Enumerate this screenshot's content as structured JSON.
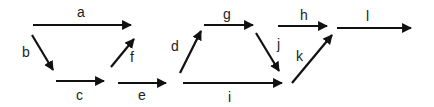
{
  "diagram": {
    "type": "directed-graph",
    "colors": {
      "edge": "#111111",
      "label": "#222222",
      "background": "#ffffff"
    },
    "edges": [
      {
        "id": "a",
        "label": "a",
        "x1": 33,
        "y1": 25,
        "x2": 131,
        "y2": 25,
        "lx": 77,
        "ly": 17
      },
      {
        "id": "b",
        "label": "b",
        "x1": 32,
        "y1": 35,
        "x2": 53,
        "y2": 70,
        "lx": 22,
        "ly": 57
      },
      {
        "id": "c",
        "label": "c",
        "x1": 56,
        "y1": 81,
        "x2": 104,
        "y2": 81,
        "lx": 76,
        "ly": 100
      },
      {
        "id": "f",
        "label": "f",
        "x1": 111,
        "y1": 67,
        "x2": 134,
        "y2": 39,
        "lx": 130,
        "ly": 62
      },
      {
        "id": "e",
        "label": "e",
        "x1": 118,
        "y1": 83,
        "x2": 166,
        "y2": 83,
        "lx": 138,
        "ly": 100
      },
      {
        "id": "d",
        "label": "d",
        "x1": 180,
        "y1": 73,
        "x2": 201,
        "y2": 31,
        "lx": 171,
        "ly": 51
      },
      {
        "id": "g",
        "label": "g",
        "x1": 204,
        "y1": 25,
        "x2": 253,
        "y2": 25,
        "lx": 223,
        "ly": 19
      },
      {
        "id": "i",
        "label": "i",
        "x1": 183,
        "y1": 83,
        "x2": 282,
        "y2": 83,
        "lx": 228,
        "ly": 102
      },
      {
        "id": "j",
        "label": "j",
        "x1": 256,
        "y1": 33,
        "x2": 279,
        "y2": 71,
        "lx": 277,
        "ly": 49
      },
      {
        "id": "h",
        "label": "h",
        "x1": 278,
        "y1": 26,
        "x2": 327,
        "y2": 26,
        "lx": 300,
        "ly": 20
      },
      {
        "id": "k",
        "label": "k",
        "x1": 292,
        "y1": 83,
        "x2": 332,
        "y2": 35,
        "lx": 296,
        "ly": 61
      },
      {
        "id": "l",
        "label": "l",
        "x1": 337,
        "y1": 28,
        "x2": 411,
        "y2": 28,
        "lx": 366,
        "ly": 21
      }
    ]
  }
}
